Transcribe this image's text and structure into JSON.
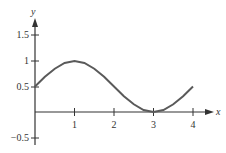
{
  "chart_data": {
    "type": "line",
    "title": "",
    "xlabel": "x",
    "ylabel": "y",
    "x_ticks": [
      "1",
      "2",
      "3",
      "4"
    ],
    "y_ticks": [
      "1.5",
      "1",
      "0.5",
      "-0.5"
    ],
    "y_tick_labels": [
      "1.5",
      "1",
      "0.5",
      "−0.5"
    ],
    "xlim": [
      0,
      4.5
    ],
    "ylim": [
      -0.5,
      1.7
    ],
    "grid": false,
    "legend": null,
    "series": [
      {
        "name": "y = 0.5 + 0.5 sin(πx/2)",
        "x": [
          0,
          0.25,
          0.5,
          0.75,
          1,
          1.25,
          1.5,
          1.75,
          2,
          2.25,
          2.5,
          2.75,
          3,
          3.25,
          3.5,
          3.75,
          4
        ],
        "y": [
          0.5,
          0.69,
          0.85,
          0.96,
          1.0,
          0.96,
          0.85,
          0.69,
          0.5,
          0.31,
          0.15,
          0.04,
          0.0,
          0.04,
          0.15,
          0.31,
          0.5
        ]
      }
    ],
    "colors": {
      "curve": "#5a5a5a",
      "axes": "#333333"
    }
  }
}
